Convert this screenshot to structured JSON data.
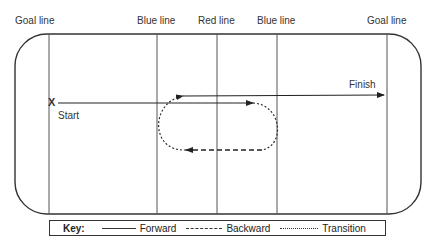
{
  "rink": {
    "line_labels": [
      {
        "id": "goal-line-left",
        "label": "Goal line"
      },
      {
        "id": "blue-line-left",
        "label": "Blue line"
      },
      {
        "id": "red-line",
        "label": "Red line"
      },
      {
        "id": "blue-line-right",
        "label": "Blue line"
      },
      {
        "id": "goal-line-right",
        "label": "Goal line"
      }
    ],
    "start_marker": "X",
    "start_label": "Start",
    "finish_label": "Finish"
  },
  "paths": [
    {
      "type": "Forward",
      "style": "solid",
      "description": "Start to just past red line"
    },
    {
      "type": "Transition",
      "style": "dotted",
      "description": "Turn around right side near blue line"
    },
    {
      "type": "Backward",
      "style": "dashed",
      "description": "Skate backward toward left blue line"
    },
    {
      "type": "Transition",
      "style": "dotted",
      "description": "Turn around left side near blue line"
    },
    {
      "type": "Forward",
      "style": "solid",
      "description": "Forward to finish at goal line"
    }
  ],
  "key": {
    "title": "Key:",
    "items": [
      {
        "label": "Forward",
        "style": "solid"
      },
      {
        "label": "Backward",
        "style": "dashed"
      },
      {
        "label": "Transition",
        "style": "dotted"
      }
    ]
  }
}
